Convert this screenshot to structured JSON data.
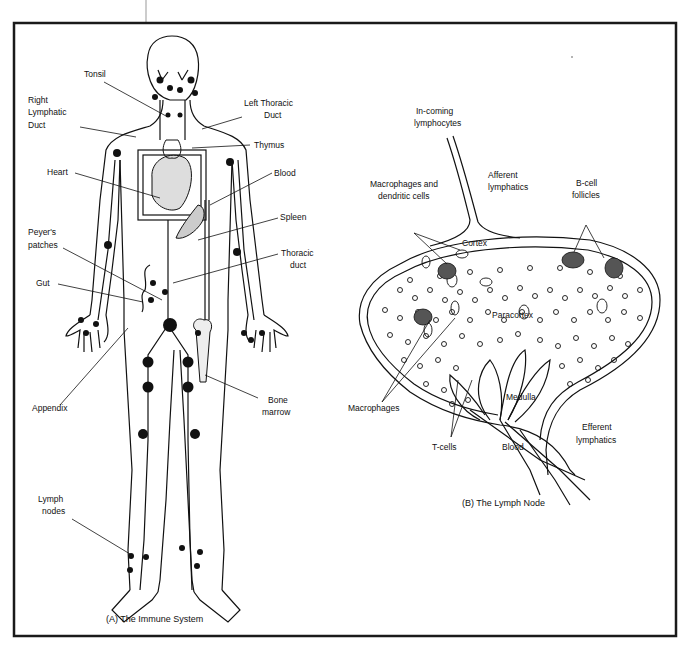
{
  "figure": {
    "panel_a": {
      "caption": "(A)  The Immune System",
      "labels": {
        "tonsil": "Tonsil",
        "right_lymphatic_duct": [
          "Right",
          "Lymphatic",
          "Duct"
        ],
        "left_thoracic_duct": [
          "Left Thoracic",
          "Duct"
        ],
        "thymus": "Thymus",
        "heart": "Heart",
        "blood": "Blood",
        "spleen": "Spleen",
        "peyers_patches": [
          "Peyer's",
          "patches"
        ],
        "thoracic_duct": [
          "Thoracic",
          "duct"
        ],
        "gut": "Gut",
        "appendix": "Appendix",
        "bone_marrow": [
          "Bone",
          "marrow"
        ],
        "lymph_nodes": [
          "Lymph",
          "nodes"
        ]
      }
    },
    "panel_b": {
      "caption": "(B)  The Lymph Node",
      "labels": {
        "incoming_lymphocytes": [
          "In-coming",
          "lymphocytes"
        ],
        "afferent_lymphatics": [
          "Afferent",
          "lymphatics"
        ],
        "macrophages_dendritic": [
          "Macrophages and",
          "dendritic cells"
        ],
        "bcell_follicles": [
          "B-cell",
          "follicles"
        ],
        "cortex": "Cortex",
        "paracortex": "Paracortex",
        "medulla": "Medulla",
        "macrophages": "Macrophages",
        "tcells": "T-cells",
        "blood": "Blood",
        "efferent_lymphatics": [
          "Efferent",
          "lymphatics"
        ]
      }
    },
    "colors": {
      "ink": "#111111",
      "background": "#ffffff",
      "frame": "#1a1a1a"
    }
  }
}
